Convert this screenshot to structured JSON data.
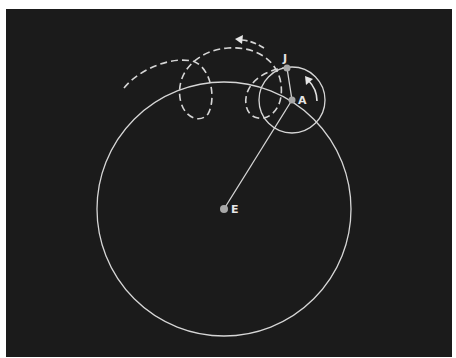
{
  "diagram": {
    "labels": {
      "earth": "E",
      "epicycle_center": "A",
      "planet": "J"
    },
    "points": {
      "E": {
        "x": 224,
        "y": 209
      },
      "A": {
        "x": 292,
        "y": 100
      },
      "J": {
        "x": 287,
        "y": 68
      }
    },
    "deferent_radius": 127,
    "epicycle_radius": 33,
    "colors": {
      "background": "#1b1b1b",
      "lines": "#d6d6d6",
      "dots": "#a8a8a8"
    },
    "arrows": {
      "path_direction": "arrow-left-icon",
      "epicycle_rotation": "arrow-counterclockwise-icon"
    }
  }
}
